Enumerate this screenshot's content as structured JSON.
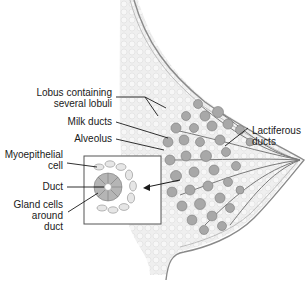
{
  "diagram": {
    "labels": {
      "lobus": [
        "Lobus containing",
        "several lobuli"
      ],
      "milk_ducts": "Milk ducts",
      "alveolus": "Alveolus",
      "myoepithelial": [
        "Myoepithelial",
        "cell"
      ],
      "duct": "Duct",
      "gland_cells": [
        "Gland cells",
        "around",
        "duct"
      ],
      "lactiferous": [
        "Lactiferous",
        "ducts"
      ]
    },
    "colors": {
      "outline": "#8a8a8a",
      "tissue_fill": "#ececec",
      "lobule_fill": "#a8a8a8",
      "lobule_stroke": "#7a7a7a",
      "leader_line": "#1a1a1a",
      "inset_border": "#555555"
    }
  }
}
